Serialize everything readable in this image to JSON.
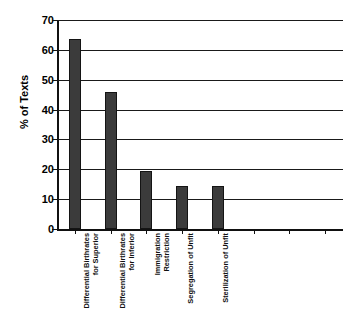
{
  "chart_data": {
    "type": "bar",
    "title": "",
    "xlabel": "",
    "ylabel": "% of Texts",
    "ylim": [
      0,
      70
    ],
    "ystep": 10,
    "grid": true,
    "legend": false,
    "orientation": "vertical",
    "bar_color": "#3b3b3b",
    "bar_edge_color": "#141414",
    "axis_color": "#111111",
    "background": "#ffffff",
    "empty_category_slots": 3,
    "categories": [
      "Differential Birthrates for Superior",
      "Differential Birthrates for Inferior",
      "Immigration Restriction",
      "Segregation of Unfit",
      "Sterilization of Unfit"
    ],
    "category_lines": [
      [
        "Differential Birthrates",
        "for Superior"
      ],
      [
        "Differential Birthrates",
        "for Inferior"
      ],
      [
        "Immigration",
        "Restriction"
      ],
      [
        "Segregation of Unfit",
        ""
      ],
      [
        "Sterilization of Unfit",
        ""
      ]
    ],
    "values": [
      63.5,
      46,
      19.5,
      14.5,
      14.5
    ],
    "ytick_labels": [
      "0",
      "10",
      "20",
      "30",
      "40",
      "50",
      "60",
      "70"
    ],
    "ytick_values": [
      0,
      10,
      20,
      30,
      40,
      50,
      60,
      70
    ]
  }
}
